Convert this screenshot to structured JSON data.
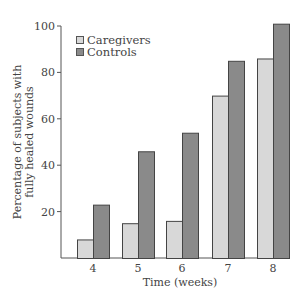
{
  "chart_data": {
    "type": "bar",
    "title": "",
    "xlabel": "Time (weeks)",
    "ylabel": "Percentage of subjects with fully healed wounds",
    "ylabel_lines": [
      "Percentage of subjects with",
      "fully healed wounds"
    ],
    "categories": [
      "4",
      "5",
      "6",
      "7",
      "8"
    ],
    "series": [
      {
        "name": "Caregivers",
        "color": "#d8d8d8",
        "values": [
          8,
          15,
          16,
          70,
          86
        ]
      },
      {
        "name": "Controls",
        "color": "#8a8a8a",
        "values": [
          23,
          46,
          54,
          85,
          101
        ]
      }
    ],
    "yticks": [
      20,
      40,
      60,
      80,
      100
    ],
    "ylim": [
      0,
      100
    ],
    "grid": false,
    "legend_position": "upper-left"
  }
}
